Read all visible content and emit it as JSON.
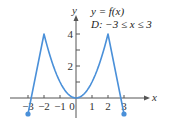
{
  "chart_data": {
    "type": "line",
    "title": "",
    "annotations": [
      "y = f(x)",
      "D:  −3 ≤ x ≤ 3"
    ],
    "xlabel": "x",
    "ylabel": "y",
    "xlim": [
      -3.2,
      3.6
    ],
    "ylim": [
      -1.2,
      4.6
    ],
    "x_ticks": [
      -3,
      -2,
      -1,
      0,
      1,
      2,
      3
    ],
    "x_tick_labels": [
      "−3",
      "−2",
      "−1",
      "0",
      "1",
      "2",
      "3"
    ],
    "y_ticks": [
      1,
      2,
      3,
      4
    ],
    "y_tick_labels": [
      "",
      "2",
      "",
      "4"
    ],
    "grid": false,
    "series": [
      {
        "name": "f(x)",
        "color": "#4a90d9",
        "points": [
          {
            "x": -3,
            "y": -1
          },
          {
            "x": -2,
            "y": 4
          },
          {
            "x": -1.5,
            "y": 2.25
          },
          {
            "x": -1,
            "y": 1
          },
          {
            "x": -0.5,
            "y": 0.25
          },
          {
            "x": 0,
            "y": 0
          },
          {
            "x": 0.5,
            "y": 0.25
          },
          {
            "x": 1,
            "y": 1
          },
          {
            "x": 1.5,
            "y": 2.25
          },
          {
            "x": 2,
            "y": 4
          },
          {
            "x": 3,
            "y": -1
          }
        ],
        "endpoints": [
          {
            "x": -3,
            "y": -1,
            "closed": true
          },
          {
            "x": 3,
            "y": -1,
            "closed": true
          }
        ]
      }
    ]
  },
  "colors": {
    "curve": "#4a90d9",
    "axis": "#555555",
    "text": "#333333"
  }
}
